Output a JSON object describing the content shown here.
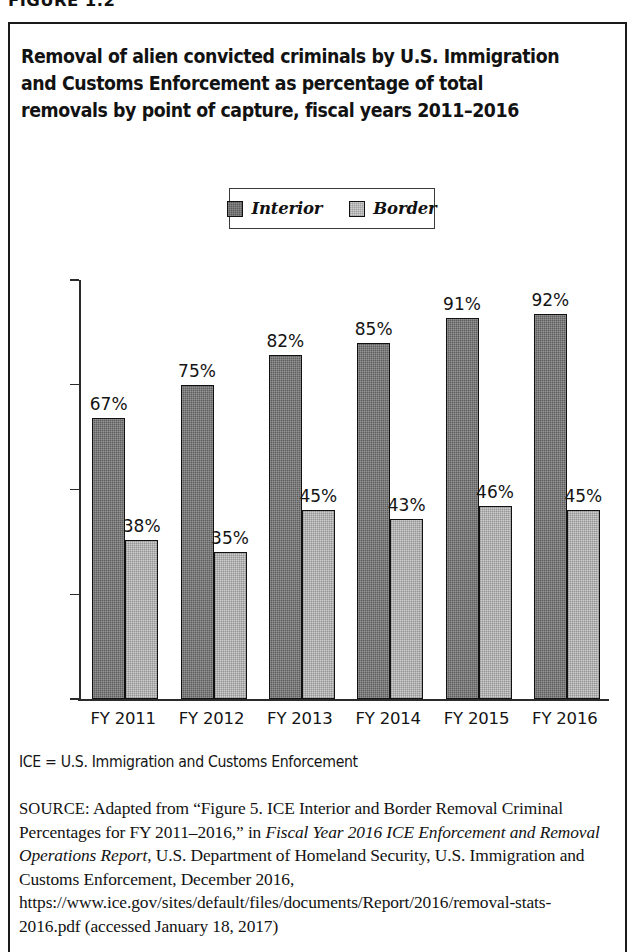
{
  "figure": {
    "number_label": "FIGURE 1.2",
    "title": "Removal of alien convicted criminals by U.S. Immigration and Customs Enforcement as percentage of total removals by point of capture, fiscal years 2011–2016"
  },
  "legend": {
    "items": [
      {
        "label": "Interior",
        "color": "#5e5e5e",
        "swatch": "interior"
      },
      {
        "label": "Border",
        "color": "#cdcdcd",
        "swatch": "border"
      }
    ]
  },
  "footnote": {
    "text": "ICE = U.S. Immigration and Customs Enforcement"
  },
  "source": {
    "label": "SOURCE:",
    "part1": " Adapted from “Figure 5. ICE Interior and Border Removal Criminal Percentages for FY 2011–2016,” in ",
    "italic1": "Fiscal Year 2016 ICE Enforcement and Removal Operations Report",
    "part2": ", U.S. Department of Homeland Security, U.S. Immigration and Customs Enforcement, December 2016, https://www.ice.gov/sites/default/files/documents/Report/2016/removal-stats-2016.pdf (accessed January 18, 2017)"
  },
  "chart_data": {
    "type": "bar",
    "title": "Removal of alien convicted criminals by U.S. Immigration and Customs Enforcement as percentage of total removals by point of capture, fiscal years 2011–2016",
    "xlabel": "",
    "ylabel": "",
    "categories": [
      "FY 2011",
      "FY 2012",
      "FY 2013",
      "FY 2014",
      "FY 2015",
      "FY 2016"
    ],
    "series": [
      {
        "name": "Interior",
        "values": [
          67,
          75,
          82,
          85,
          91,
          92
        ],
        "value_labels": [
          "67%",
          "75%",
          "82%",
          "85%",
          "91%",
          "92%"
        ],
        "color": "#5e5e5e"
      },
      {
        "name": "Border",
        "values": [
          38,
          35,
          45,
          43,
          46,
          45
        ],
        "value_labels": [
          "38%",
          "35%",
          "45%",
          "43%",
          "46%",
          "45%"
        ],
        "color": "#cdcdcd"
      }
    ],
    "ylim": [
      0,
      100
    ],
    "yticks": [
      0,
      25,
      50,
      75,
      100
    ],
    "ytick_labels": [
      "0%",
      "25%",
      "50%",
      "75%",
      "100%"
    ],
    "grid": false,
    "legend_position": "top-center",
    "units": "percent"
  }
}
